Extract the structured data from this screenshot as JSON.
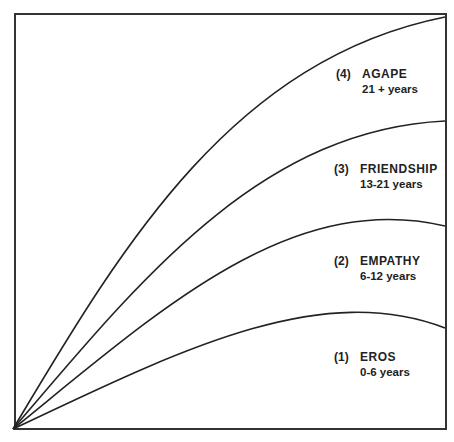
{
  "diagram": {
    "type": "stage-curves",
    "frame_color": "#333333",
    "curve_color": "#222222",
    "stages": [
      {
        "number": "(4)",
        "name": "AGAPE",
        "years": "21 + years"
      },
      {
        "number": "(3)",
        "name": "FRIENDSHIP",
        "years": "13-21 years"
      },
      {
        "number": "(2)",
        "name": "EMPATHY",
        "years": "6-12 years"
      },
      {
        "number": "(1)",
        "name": "EROS",
        "years": "0-6 years"
      }
    ]
  }
}
